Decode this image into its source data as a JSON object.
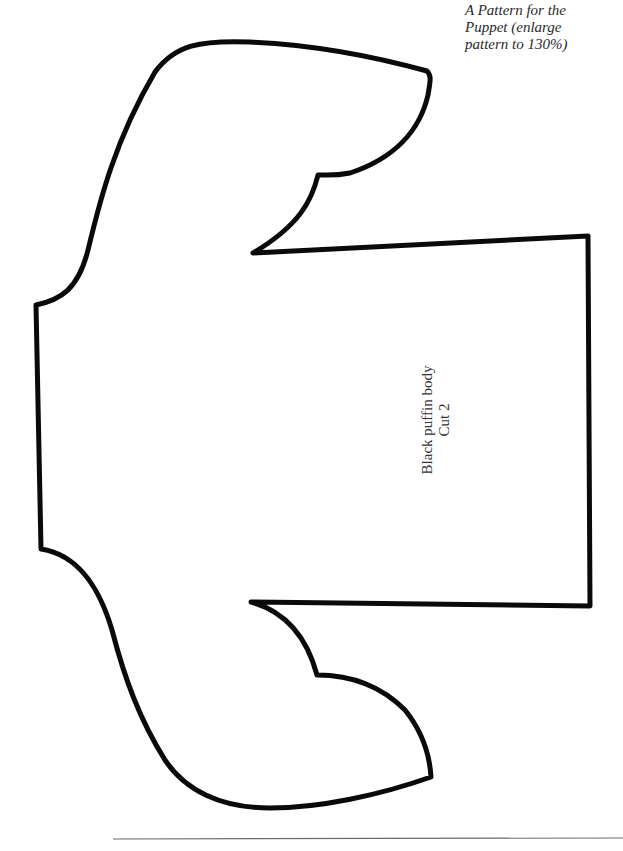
{
  "caption": {
    "lines": [
      "A Pattern for the",
      "Puppet (enlarge",
      "pattern to 130%)"
    ]
  },
  "piece": {
    "name": "Black puffin body",
    "instruction": "Cut 2"
  },
  "colors": {
    "outline": "#0a0a0a",
    "rule": "#6a6a6a",
    "text": "#2a2a2a",
    "background": "#ffffff"
  }
}
